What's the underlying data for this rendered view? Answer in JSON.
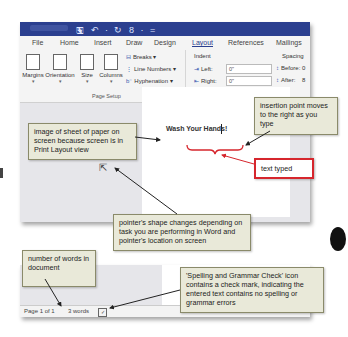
{
  "window": {
    "quick_access": "🖫 ↶ · ↻ 8 · ="
  },
  "tabs": [
    {
      "label": "File"
    },
    {
      "label": "Home"
    },
    {
      "label": "Insert"
    },
    {
      "label": "Draw"
    },
    {
      "label": "Design"
    },
    {
      "label": "Layout",
      "active": true
    },
    {
      "label": "References"
    },
    {
      "label": "Mailings"
    }
  ],
  "ribbon": {
    "page_setup": {
      "buttons": [
        {
          "label": "Margins"
        },
        {
          "label": "Orientation"
        },
        {
          "label": "Size"
        },
        {
          "label": "Columns"
        }
      ],
      "small_items": [
        {
          "label": "Breaks ▾"
        },
        {
          "label": "Line Numbers ▾"
        },
        {
          "label": "Hyphenation ▾"
        }
      ],
      "group_label": "Page Setup",
      "launcher": "↘"
    },
    "paragraph": {
      "indent_label": "Indent",
      "spacing_label": "Spacing",
      "left_label": "Left:",
      "left_value": "0\"",
      "right_label": "Right:",
      "right_value": "0\"",
      "before_label": "Before:",
      "before_value": "0",
      "after_label": "After:",
      "after_value": "8",
      "group_label": "Pa"
    }
  },
  "document": {
    "text": "Wash Your Hands!"
  },
  "status_bar": {
    "page": "Page 1 of 1",
    "words": "3 words"
  },
  "callouts": {
    "insertion_point": "insertion point moves to the right as you type",
    "print_layout": "image of sheet of paper on screen because screen is in Print Layout view",
    "text_typed": "text typed",
    "pointer_shape": "pointer's shape changes depending on task you are performing in Word and pointer's location on screen",
    "word_count": "number of words in document",
    "spelling": "'Spelling and Grammar Check' icon contains a check mark, indicating the entered text contains no spelling or grammar errors"
  },
  "colors": {
    "titlebar": "#2b3f8f",
    "callout_bg": "#e9e9d9",
    "callout_red": "#d6262d"
  }
}
